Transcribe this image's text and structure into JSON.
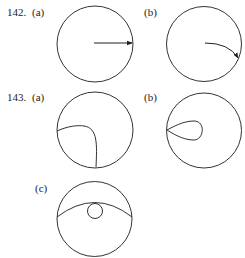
{
  "problems": [
    {
      "number": "142.",
      "parts": [
        {
          "label": "(a)",
          "description": "circle with straight arrow from center to boundary"
        },
        {
          "label": "(b)",
          "description": "circle with curved arrow from center to boundary"
        }
      ]
    },
    {
      "number": "143.",
      "parts": [
        {
          "label": "(a)",
          "description": "circle with curved arc meeting boundary at two points"
        },
        {
          "label": "(b)",
          "description": "circle with teardrop loop attached to boundary"
        },
        {
          "label": "(c)",
          "description": "circle with arc chord and small inner circle"
        }
      ]
    }
  ]
}
